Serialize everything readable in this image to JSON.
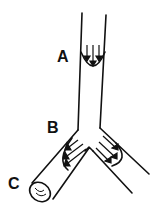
{
  "diagram": {
    "type": "branching tube flow profile",
    "labels": {
      "a": "A",
      "b": "B",
      "c": "C"
    },
    "stroke_color": "#111111",
    "background": "#ffffff"
  }
}
